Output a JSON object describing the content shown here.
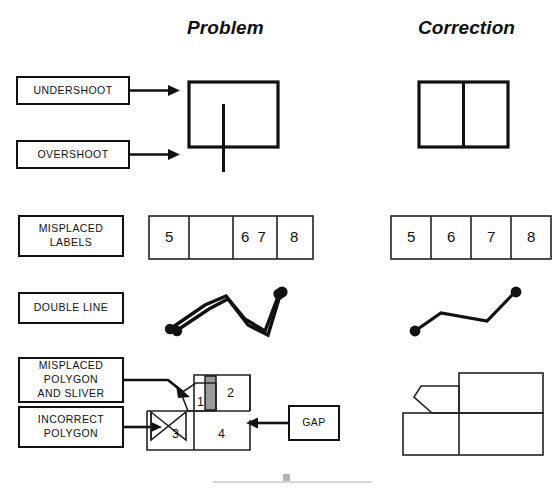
{
  "headers": {
    "problem": "Problem",
    "correction": "Correction"
  },
  "labels": {
    "undershoot": "UNDERSHOOT",
    "overshoot": "OVERSHOOT",
    "misplaced_labels_line1": "MISPLACED",
    "misplaced_labels_line2": "LABELS",
    "double_line": "DOUBLE LINE",
    "misplaced_polygon_line1": "MISPLACED",
    "misplaced_polygon_line2": "POLYGON",
    "misplaced_polygon_line3": "AND SLIVER",
    "incorrect_polygon_line1": "INCORRECT",
    "incorrect_polygon_line2": "POLYGON",
    "gap": "GAP"
  },
  "misplaced_labels_row": {
    "problem_cells": [
      "5",
      "",
      "6 7",
      "8"
    ],
    "correction_cells": [
      "5",
      "6",
      "7",
      "8"
    ]
  },
  "polygon_figure": {
    "problem_numbers": [
      "1",
      "2",
      "3",
      "4"
    ],
    "sliver_color": "#9a9a9a"
  },
  "colors": {
    "ink": "#111111",
    "sliver": "#9a9a9a",
    "artifact": "#c9c9c9",
    "background": "#ffffff"
  }
}
